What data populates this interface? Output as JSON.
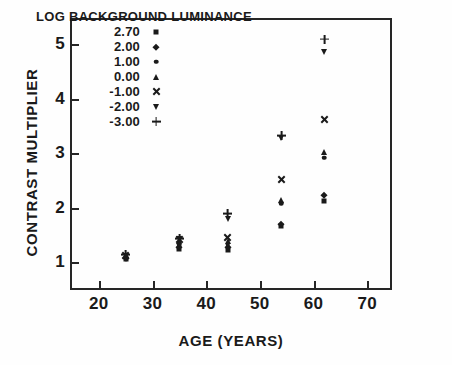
{
  "chart_data": {
    "type": "scatter",
    "title": "",
    "xlabel": "AGE (YEARS)",
    "ylabel": "CONTRAST MULTIPLIER",
    "xlim": [
      15,
      75
    ],
    "ylim": [
      0.45,
      5.45
    ],
    "xticks": [
      20,
      30,
      40,
      50,
      60,
      70
    ],
    "yticks": [
      1,
      2,
      3,
      4,
      5
    ],
    "grid": false,
    "legend_position": "upper-left-inside",
    "legend_title": "LOG BACKGROUND LUMINANCE",
    "series": [
      {
        "name": "2.70",
        "marker": "square",
        "x": [
          25,
          35,
          44,
          54,
          62
        ],
        "y": [
          1.06,
          1.24,
          1.22,
          1.67,
          2.12
        ]
      },
      {
        "name": "2.00",
        "marker": "diamond",
        "x": [
          25,
          35,
          44,
          54,
          62
        ],
        "y": [
          1.08,
          1.28,
          1.27,
          1.7,
          2.24
        ]
      },
      {
        "name": "1.00",
        "marker": "circle",
        "x": [
          25,
          35,
          44,
          54,
          62
        ],
        "y": [
          1.1,
          1.32,
          1.33,
          2.08,
          2.92
        ]
      },
      {
        "name": "0.00",
        "marker": "triangle-up",
        "x": [
          25,
          35,
          44,
          54,
          62
        ],
        "y": [
          1.13,
          1.38,
          1.38,
          2.14,
          3.02
        ]
      },
      {
        "name": "-1.00",
        "marker": "x",
        "x": [
          25,
          35,
          44,
          54,
          62
        ],
        "y": [
          1.13,
          1.41,
          1.46,
          2.52,
          3.62
        ]
      },
      {
        "name": "-2.00",
        "marker": "triangle-down",
        "x": [
          25,
          35,
          44,
          54,
          62
        ],
        "y": [
          1.12,
          1.42,
          1.79,
          3.28,
          4.87
        ]
      },
      {
        "name": "-3.00",
        "marker": "plus",
        "x": [
          25,
          35,
          44,
          54,
          62
        ],
        "y": [
          1.14,
          1.43,
          1.89,
          3.32,
          5.1
        ]
      }
    ]
  }
}
